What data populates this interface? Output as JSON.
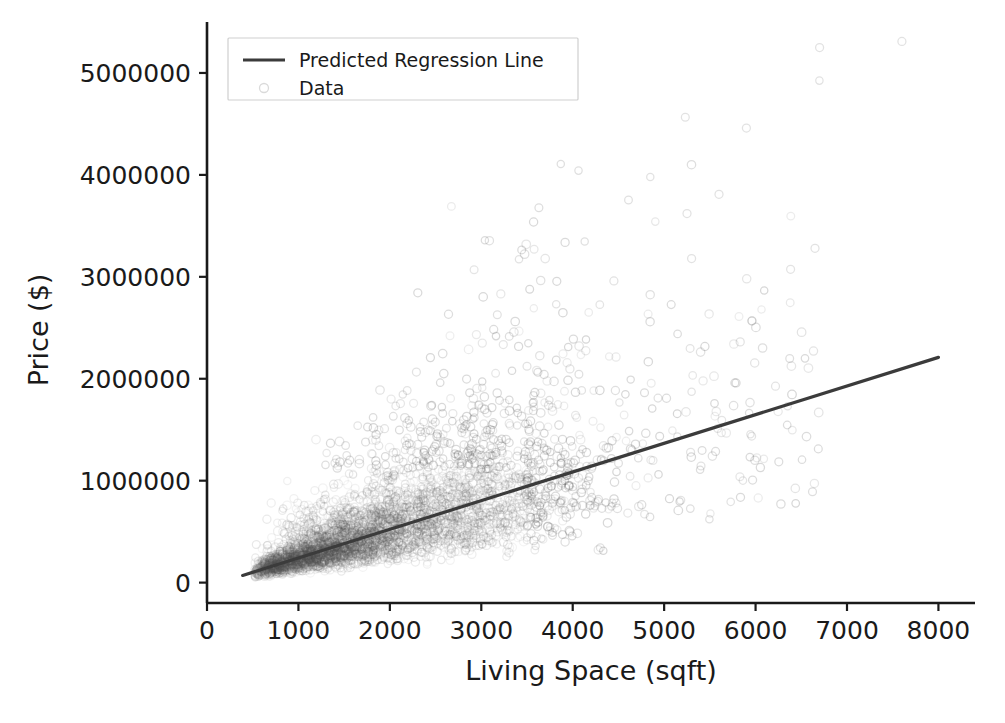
{
  "chart_data": {
    "type": "scatter",
    "title": "",
    "xlabel": "Living Space (sqft)",
    "ylabel": "Price ($)",
    "xlim": [
      0,
      8400
    ],
    "ylim": [
      -200000,
      5500000
    ],
    "grid": false,
    "legend_position": "upper left",
    "legend": [
      {
        "label": "Predicted Regression Line",
        "handle": "line",
        "color": "#3b3b3b"
      },
      {
        "label": "Data",
        "handle": "marker",
        "color": "#555555"
      }
    ],
    "xticks": [
      0,
      1000,
      2000,
      3000,
      4000,
      5000,
      6000,
      7000,
      8000
    ],
    "xtick_labels": [
      "0",
      "1000",
      "2000",
      "3000",
      "4000",
      "5000",
      "6000",
      "7000",
      "8000"
    ],
    "yticks": [
      0,
      1000000,
      2000000,
      3000000,
      4000000,
      5000000
    ],
    "ytick_labels": [
      "0",
      "1000000",
      "2000000",
      "3000000",
      "4000000",
      "5000000"
    ],
    "series": [
      {
        "name": "Predicted Regression Line",
        "type": "line",
        "color": "#3b3b3b",
        "x": [
          390,
          8000
        ],
        "y": [
          70000,
          2210000
        ],
        "slope": 281.2,
        "intercept": -39700
      },
      {
        "name": "Data",
        "type": "scatter",
        "color": "#555555",
        "marker": "o",
        "filled": false,
        "alpha": 0.12,
        "n_points": 4200,
        "x_range": [
          350,
          8100
        ],
        "y_range": [
          30000,
          5320000
        ],
        "density_core_x": [
          600,
          3500
        ],
        "density_core_y": [
          120000,
          900000
        ],
        "notable_outliers": [
          {
            "x": 6700,
            "y": 5250000
          },
          {
            "x": 7600,
            "y": 5310000
          },
          {
            "x": 5900,
            "y": 4460000
          },
          {
            "x": 5250,
            "y": 3620000
          },
          {
            "x": 5600,
            "y": 3810000
          },
          {
            "x": 6650,
            "y": 3280000
          },
          {
            "x": 5300,
            "y": 3180000
          },
          {
            "x": 4450,
            "y": 2960000
          }
        ]
      }
    ]
  },
  "axes": {
    "x_axis_label": "Living Space (sqft)",
    "y_axis_label": "Price ($)"
  }
}
